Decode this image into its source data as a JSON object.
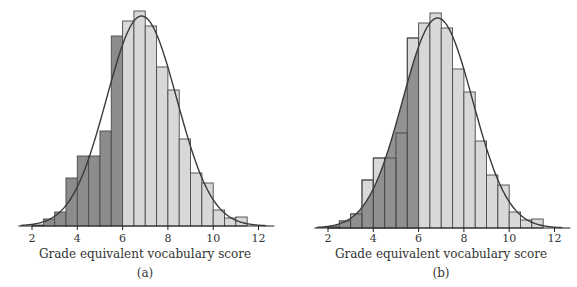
{
  "chart_data": [
    {
      "type": "bar",
      "panel": "(a)",
      "title": "",
      "xlabel": "Grade equivalent vocabulary score",
      "ylabel": "",
      "caption": "(a)",
      "xlim": [
        1.4,
        12.7
      ],
      "xticks": [
        2,
        4,
        6,
        8,
        10,
        12
      ],
      "bin_width": 0.5,
      "bin_starts": [
        2,
        2.5,
        3,
        3.5,
        4,
        4.5,
        5,
        5.5,
        6,
        6.5,
        7,
        7.5,
        8,
        8.5,
        9,
        9.5,
        10,
        10.5,
        11
      ],
      "values": [
        1,
        7,
        14,
        48,
        70,
        70,
        95,
        190,
        205,
        215,
        200,
        159,
        136,
        87,
        53,
        43,
        16,
        8,
        9
      ],
      "shading": "bars with score < 6 shaded dark",
      "shade_below": 6,
      "overlay": {
        "type": "normal-curve",
        "mean": 6.84,
        "sd": 1.55,
        "peak": 210
      },
      "grid": false,
      "legend": null
    },
    {
      "type": "bar",
      "panel": "(b)",
      "title": "",
      "xlabel": "Grade equivalent vocabulary score",
      "ylabel": "",
      "caption": "(b)",
      "xlim": [
        1.4,
        12.7
      ],
      "xticks": [
        2,
        4,
        6,
        8,
        10,
        12
      ],
      "bin_width": 0.5,
      "bin_starts": [
        2,
        2.5,
        3,
        3.5,
        4,
        4.5,
        5,
        5.5,
        6,
        6.5,
        7,
        7.5,
        8,
        8.5,
        9,
        9.5,
        10,
        10.5,
        11
      ],
      "values": [
        1,
        7,
        14,
        48,
        70,
        70,
        95,
        190,
        205,
        215,
        200,
        159,
        136,
        87,
        53,
        43,
        16,
        8,
        9
      ],
      "shading": "area under normal curve for score < 6 shaded dark",
      "shade_below": 6,
      "overlay": {
        "type": "normal-curve",
        "mean": 6.84,
        "sd": 1.55,
        "peak": 210
      },
      "grid": false,
      "legend": null
    }
  ],
  "colors": {
    "dark_fill": "#8c8c8c",
    "light_fill": "#d8d8d8",
    "edge": "#4a4a4a",
    "curve": "#3a3a3a",
    "axis": "#222222"
  },
  "panels": [
    {
      "x0": 32,
      "unit_px": 22.65,
      "baseline": 226,
      "offset": 0,
      "mode": "bars"
    },
    {
      "x0": 328,
      "unit_px": 22.65,
      "baseline": 228,
      "offset": 289,
      "mode": "curve"
    }
  ]
}
